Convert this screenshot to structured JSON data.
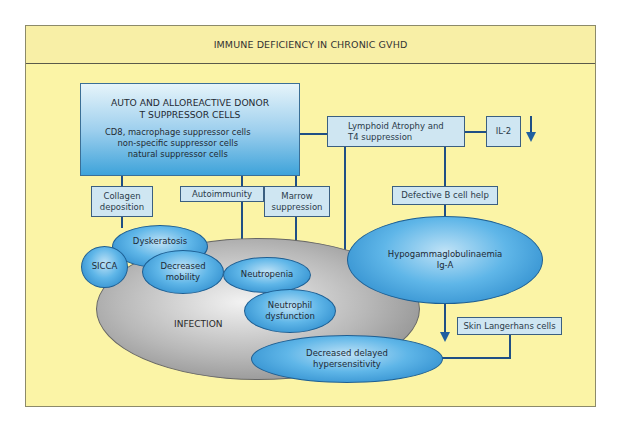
{
  "diagram": {
    "title": "IMMUNE DEFICIENCY IN CHRONIC GVHD",
    "colors": {
      "background": "#fbf4a6",
      "box_fill": "#cfe6f2",
      "connector": "#1f4f85",
      "ellipse_fill": "#5fb6e8",
      "infection_fill": "#b8b8b8"
    },
    "nodes": {
      "donor_cells": {
        "title": "AUTO AND ALLOREACTIVE DONOR\nT SUPPRESSOR CELLS",
        "title_line1": "AUTO AND ALLOREACTIVE DONOR",
        "title_line2": "T SUPPRESSOR CELLS",
        "detail_line1": "CD8, macrophage suppressor cells",
        "detail_line2": "non-specific suppressor cells",
        "detail_line3": "natural suppressor cells"
      },
      "lymphoid": {
        "line1": "Lymphoid Atrophy and",
        "line2": "T4 suppression"
      },
      "il2": {
        "label": "IL-2",
        "trend": "decrease"
      },
      "collagen": {
        "line1": "Collagen",
        "line2": "deposition"
      },
      "autoimmunity": {
        "label": "Autoimmunity"
      },
      "marrow": {
        "line1": "Marrow",
        "line2": "suppression"
      },
      "defective_b": {
        "label": "Defective B cell help"
      },
      "dyskeratosis": {
        "label": "Dyskeratosis"
      },
      "sicca": {
        "label": "SICCA"
      },
      "decreased_mobility": {
        "line1": "Decreased",
        "line2": "mobility"
      },
      "neutropenia": {
        "label": "Neutropenia"
      },
      "neutrophil_dysfunction": {
        "line1": "Neutrophil",
        "line2": "dysfunction"
      },
      "infection": {
        "label": "INFECTION"
      },
      "hypogamma": {
        "line1": "Hypogammaglobulinaemia",
        "line2": "Ig-A"
      },
      "skin_langerhans": {
        "label": "Skin Langerhans cells"
      },
      "delayed_hyper": {
        "line1": "Decreased delayed",
        "line2": "hypersensitivity"
      }
    },
    "edges": [
      [
        "donor_cells",
        "lymphoid"
      ],
      [
        "donor_cells",
        "collagen"
      ],
      [
        "donor_cells",
        "autoimmunity"
      ],
      [
        "donor_cells",
        "marrow"
      ],
      [
        "lymphoid",
        "il2"
      ],
      [
        "lymphoid",
        "defective_b"
      ],
      [
        "lymphoid",
        "delayed_hyper"
      ],
      [
        "defective_b",
        "hypogamma"
      ],
      [
        "hypogamma",
        "skin_langerhans"
      ],
      [
        "skin_langerhans",
        "delayed_hyper"
      ],
      [
        "collagen",
        "dyskeratosis"
      ],
      [
        "autoimmunity",
        "neutropenia"
      ],
      [
        "marrow",
        "neutropenia"
      ]
    ]
  }
}
